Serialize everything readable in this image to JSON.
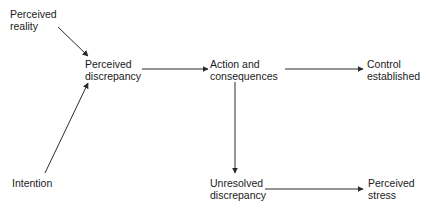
{
  "diagram": {
    "nodes": [
      {
        "id": "perceived_reality",
        "line1": "Perceived",
        "line2": "reality"
      },
      {
        "id": "perceived_discrepancy",
        "line1": "Perceived",
        "line2": "discrepancy"
      },
      {
        "id": "action_consequences",
        "line1": "Action and",
        "line2": "consequences"
      },
      {
        "id": "control_established",
        "line1": "Control",
        "line2": "established"
      },
      {
        "id": "intention",
        "line1": "Intention",
        "line2": ""
      },
      {
        "id": "unresolved_discrepancy",
        "line1": "Unresolved",
        "line2": "discrepancy"
      },
      {
        "id": "perceived_stress",
        "line1": "Perceived",
        "line2": "stress"
      }
    ],
    "edges": [
      {
        "from": "perceived_reality",
        "to": "perceived_discrepancy"
      },
      {
        "from": "intention",
        "to": "perceived_discrepancy"
      },
      {
        "from": "perceived_discrepancy",
        "to": "action_consequences"
      },
      {
        "from": "action_consequences",
        "to": "control_established"
      },
      {
        "from": "action_consequences",
        "to": "unresolved_discrepancy"
      },
      {
        "from": "unresolved_discrepancy",
        "to": "perceived_stress"
      }
    ],
    "colors": {
      "line": "#2a2a2a",
      "text": "#1a1a1a",
      "background": "#ffffff"
    }
  }
}
